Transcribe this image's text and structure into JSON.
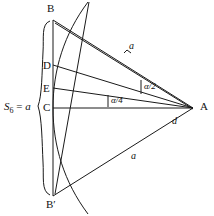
{
  "figure": {
    "vertices": [
      {
        "id": "B",
        "label": "B",
        "x": 53,
        "y": 20,
        "label_x": 47,
        "label_y": 3
      },
      {
        "id": "D",
        "label": "D",
        "x": 53,
        "y": 65,
        "label_x": 43,
        "label_y": 60
      },
      {
        "id": "E",
        "label": "E",
        "x": 53,
        "y": 88,
        "label_x": 43,
        "label_y": 83
      },
      {
        "id": "C",
        "label": "C",
        "x": 53,
        "y": 108,
        "label_x": 43,
        "label_y": 103
      },
      {
        "id": "Bprime",
        "label": "B′",
        "x": 53,
        "y": 196,
        "label_x": 46,
        "label_y": 200
      },
      {
        "id": "A",
        "label": "A",
        "x": 193,
        "y": 108,
        "label_x": 200,
        "label_y": 102
      }
    ],
    "measure_labels": [
      {
        "id": "a-upper",
        "text": "a",
        "x": 129,
        "y": 43
      },
      {
        "id": "a-lower",
        "text": "a",
        "x": 131,
        "y": 153
      },
      {
        "id": "d",
        "text": "d",
        "x": 172,
        "y": 117
      }
    ],
    "angle_labels": [
      {
        "id": "alpha-half",
        "text": "α/2",
        "x": 145,
        "y": 85
      },
      {
        "id": "alpha-quarter",
        "text": "α/4",
        "x": 112,
        "y": 99
      }
    ],
    "segment_label": {
      "id": "s6",
      "symbol": "S",
      "subscript": "6",
      "equals": " = ",
      "value": "a",
      "x": 4,
      "y": 102
    },
    "colors": {
      "stroke": "#1a1a1a",
      "background": "#ffffff",
      "text": "#111111"
    }
  }
}
